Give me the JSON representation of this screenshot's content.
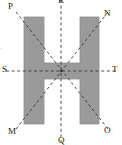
{
  "figure": {
    "shape_name": "h-shape",
    "fill_color": "#9a9a9a",
    "stroke_color": "#8a8a8a",
    "axis_color": "#3a3a3a",
    "background": "#ffffff"
  },
  "labels": {
    "top_left": "P",
    "top_right": "N",
    "bottom_left": "M",
    "bottom_right": "O",
    "left": "S",
    "right": "T",
    "top_center": "R",
    "bottom_center": "Q",
    "left_small": "."
  },
  "geometry": {
    "center_x": 61,
    "center_y": 71,
    "left_leg_x": 24,
    "left_leg_right": 44,
    "right_leg_x": 80,
    "right_leg_right": 99,
    "top_y": 17,
    "bottom_y": 124,
    "crossbar_top": 63,
    "crossbar_bottom": 79
  },
  "axes": [
    {
      "name": "vertical-axis",
      "x1": 61,
      "y1": 0,
      "x2": 61,
      "y2": 145
    },
    {
      "name": "horizontal-axis",
      "x1": 6,
      "y1": 71,
      "x2": 116,
      "y2": 71
    },
    {
      "name": "diagonal-axis-pm-o",
      "x1": 16,
      "y1": 12,
      "x2": 108,
      "y2": 128
    },
    {
      "name": "diagonal-axis-mn",
      "x1": 16,
      "y1": 128,
      "x2": 108,
      "y2": 12
    }
  ]
}
